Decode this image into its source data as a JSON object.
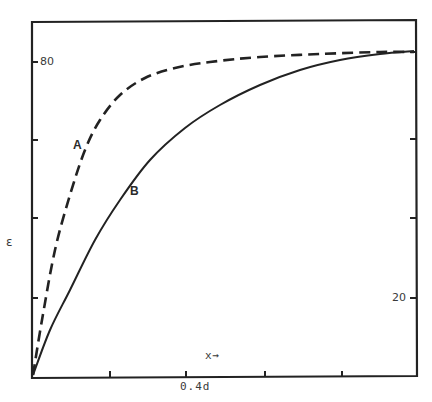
{
  "chart_data": {
    "type": "line",
    "title": "",
    "xlabel": "x→",
    "ylabel": "ε",
    "x_tick_labels": [
      {
        "label": "0.4d",
        "position": 0.4
      }
    ],
    "y_tick_labels_left": [
      {
        "label": "80",
        "value": 80
      }
    ],
    "y_tick_labels_right": [
      {
        "label": "20",
        "value": 20
      }
    ],
    "grid": false,
    "legend": "none (curves labelled inline A and B)",
    "x_range_fraction_of_d": [
      0,
      1.0
    ],
    "series": [
      {
        "name": "A",
        "style": "dashed",
        "description": "rises steeply, saturates early near top",
        "x_fraction": [
          0,
          0.02,
          0.06,
          0.1,
          0.14,
          0.18,
          0.23,
          0.29,
          0.37,
          0.46,
          0.59,
          0.75,
          0.9,
          1.0
        ],
        "y_relative": [
          0,
          0.15,
          0.35,
          0.5,
          0.63,
          0.72,
          0.79,
          0.84,
          0.87,
          0.88,
          0.9,
          0.91,
          0.91,
          0.91
        ]
      },
      {
        "name": "B",
        "style": "solid",
        "description": "rises gradually, approaches same saturation value at right edge",
        "x_fraction": [
          0,
          0.04,
          0.1,
          0.16,
          0.23,
          0.3,
          0.4,
          0.49,
          0.59,
          0.7,
          0.8,
          0.9,
          1.0
        ],
        "y_relative": [
          0,
          0.13,
          0.24,
          0.38,
          0.49,
          0.6,
          0.69,
          0.76,
          0.81,
          0.86,
          0.89,
          0.9,
          0.91
        ]
      }
    ]
  },
  "plot": {
    "frame": {
      "left": 32,
      "right": 416,
      "top": 22,
      "bottom": 378
    },
    "left_ticks_y": [
      62,
      140,
      218,
      298
    ],
    "right_ticks_y": [
      52,
      139,
      218,
      298
    ],
    "bottom_ticks_x": [
      110,
      186,
      265,
      342
    ],
    "curve_a_points": [
      [
        33,
        375
      ],
      [
        42,
        320
      ],
      [
        55,
        250
      ],
      [
        70,
        195
      ],
      [
        85,
        150
      ],
      [
        100,
        120
      ],
      [
        120,
        95
      ],
      [
        145,
        78
      ],
      [
        175,
        68
      ],
      [
        210,
        62
      ],
      [
        260,
        57
      ],
      [
        320,
        54
      ],
      [
        380,
        52
      ],
      [
        414,
        52
      ]
    ],
    "curve_b_points": [
      [
        33,
        375
      ],
      [
        50,
        330
      ],
      [
        70,
        290
      ],
      [
        95,
        240
      ],
      [
        120,
        200
      ],
      [
        150,
        160
      ],
      [
        185,
        128
      ],
      [
        220,
        105
      ],
      [
        260,
        85
      ],
      [
        300,
        70
      ],
      [
        340,
        60
      ],
      [
        380,
        54
      ],
      [
        414,
        51
      ]
    ],
    "line_color": "#222222"
  },
  "labels": {
    "y_tick_80": "80",
    "y_tick_20": "20",
    "y_axis": "ε",
    "x_axis": "x→",
    "x_tick_04d": "0.4d",
    "curve_a": "A",
    "curve_b": "B"
  }
}
